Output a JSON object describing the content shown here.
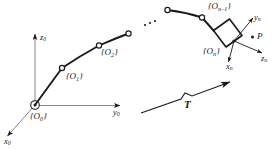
{
  "figure": {
    "type": "kinematic-chain-diagram",
    "background_color": "#ffffff",
    "stroke_color": "#1a1a1a"
  },
  "base_frame": {
    "origin_label": "{O",
    "origin_sub": "0",
    "origin_close": "}",
    "axes": [
      {
        "name": "z-axis-base",
        "label": "z",
        "sub": "0"
      },
      {
        "name": "y-axis-base",
        "label": "y",
        "sub": "0"
      },
      {
        "name": "x-axis-base",
        "label": "x",
        "sub": "0"
      }
    ]
  },
  "joints": [
    {
      "name": "joint-1",
      "label": "{O",
      "sub": "1",
      "close": "}"
    },
    {
      "name": "joint-2",
      "label": "{O",
      "sub": "2",
      "close": "}"
    },
    {
      "name": "joint-n-1",
      "label": "{O",
      "sub": "n–1",
      "close": "}"
    }
  ],
  "ellipsis": {
    "name": "chain-ellipsis",
    "text": "· · ·"
  },
  "end_effector": {
    "frame_label": "{O",
    "frame_sub": "n",
    "frame_close": "}",
    "axes": [
      {
        "name": "y-axis-ee",
        "label": "y",
        "sub": "n"
      },
      {
        "name": "z-axis-ee",
        "label": "z",
        "sub": "n"
      },
      {
        "name": "x-axis-ee",
        "label": "x",
        "sub": "n"
      }
    ],
    "point": {
      "name": "point-p",
      "label": "P"
    }
  },
  "transform": {
    "label": "T",
    "name": "transform-arrow"
  }
}
